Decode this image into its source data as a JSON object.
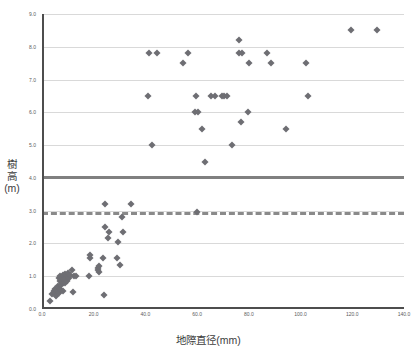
{
  "chart_data": {
    "type": "scatter",
    "title": "",
    "xlabel": "地際直径(mm)",
    "ylabel": "樹高(m)",
    "xlim": [
      0.0,
      140.0
    ],
    "ylim": [
      0.0,
      9.0
    ],
    "xticks": [
      "0.0",
      "20.0",
      "40.0",
      "60.0",
      "80.0",
      "100.0",
      "120.0",
      "140.0"
    ],
    "xtick_values": [
      0,
      20,
      40,
      60,
      80,
      100,
      120,
      140
    ],
    "yticks": [
      "0.0",
      "1.0",
      "2.0",
      "3.0",
      "4.0",
      "5.0",
      "6.0",
      "7.0",
      "8.0",
      "9.0"
    ],
    "ytick_values": [
      0,
      1,
      2,
      3,
      4,
      5,
      6,
      7,
      8,
      9
    ],
    "grid": "horizontal",
    "legend": "none",
    "marker": {
      "shape": "diamond",
      "color": "#6e6e73",
      "size": 5
    },
    "reference_lines": [
      {
        "name": "solid-threshold",
        "orientation": "horizontal",
        "y": 4.05,
        "style": "solid",
        "color": "#808080",
        "width": 3
      },
      {
        "name": "dashed-threshold",
        "orientation": "horizontal",
        "y": 2.95,
        "style": "dashed",
        "color": "#8a8a8a",
        "width": 3
      }
    ],
    "points": [
      [
        3.0,
        0.25
      ],
      [
        4.0,
        0.45
      ],
      [
        4.5,
        0.55
      ],
      [
        5.0,
        0.5
      ],
      [
        5.0,
        0.62
      ],
      [
        5.5,
        0.4
      ],
      [
        6.0,
        0.55
      ],
      [
        6.0,
        0.7
      ],
      [
        6.5,
        0.48
      ],
      [
        6.5,
        0.95
      ],
      [
        7.0,
        0.6
      ],
      [
        7.0,
        0.85
      ],
      [
        7.0,
        1.0
      ],
      [
        7.5,
        0.72
      ],
      [
        7.5,
        0.9
      ],
      [
        8.0,
        0.55
      ],
      [
        8.0,
        0.8
      ],
      [
        8.0,
        0.95
      ],
      [
        8.0,
        1.05
      ],
      [
        8.5,
        0.88
      ],
      [
        8.5,
        1.0
      ],
      [
        9.0,
        0.78
      ],
      [
        9.0,
        0.92
      ],
      [
        9.0,
        1.08
      ],
      [
        9.5,
        0.85
      ],
      [
        10.0,
        1.0
      ],
      [
        10.0,
        1.1
      ],
      [
        10.5,
        0.95
      ],
      [
        11.0,
        1.05
      ],
      [
        11.5,
        1.18
      ],
      [
        12.0,
        0.52
      ],
      [
        12.5,
        1.02
      ],
      [
        13.0,
        1.0
      ],
      [
        18.0,
        1.0
      ],
      [
        18.5,
        1.55
      ],
      [
        18.5,
        1.65
      ],
      [
        21.5,
        1.18
      ],
      [
        21.5,
        1.25
      ],
      [
        22.0,
        1.12
      ],
      [
        22.0,
        1.3
      ],
      [
        23.5,
        1.55
      ],
      [
        24.0,
        0.42
      ],
      [
        24.5,
        2.5
      ],
      [
        24.5,
        3.2
      ],
      [
        25.5,
        2.18
      ],
      [
        26.0,
        2.35
      ],
      [
        29.0,
        1.55
      ],
      [
        29.5,
        2.05
      ],
      [
        30.0,
        1.35
      ],
      [
        31.0,
        2.8
      ],
      [
        31.5,
        2.35
      ],
      [
        34.5,
        3.2
      ],
      [
        41.0,
        6.5
      ],
      [
        41.5,
        7.8
      ],
      [
        44.5,
        7.8
      ],
      [
        42.5,
        5.0
      ],
      [
        54.5,
        7.5
      ],
      [
        56.5,
        7.8
      ],
      [
        59.5,
        6.5
      ],
      [
        59.0,
        6.0
      ],
      [
        60.5,
        6.0
      ],
      [
        60.0,
        2.95
      ],
      [
        62.0,
        5.5
      ],
      [
        63.0,
        4.5
      ],
      [
        65.5,
        6.5
      ],
      [
        67.0,
        6.5
      ],
      [
        69.5,
        6.5
      ],
      [
        70.5,
        6.5
      ],
      [
        71.5,
        6.5
      ],
      [
        73.5,
        5.0
      ],
      [
        76.0,
        8.2
      ],
      [
        76.0,
        7.8
      ],
      [
        77.5,
        7.8
      ],
      [
        77.0,
        5.7
      ],
      [
        79.5,
        6.0
      ],
      [
        80.0,
        7.5
      ],
      [
        87.0,
        7.8
      ],
      [
        88.5,
        7.5
      ],
      [
        94.5,
        5.5
      ],
      [
        102.0,
        7.5
      ],
      [
        103.0,
        6.5
      ],
      [
        119.5,
        8.5
      ],
      [
        129.5,
        8.5
      ]
    ]
  }
}
